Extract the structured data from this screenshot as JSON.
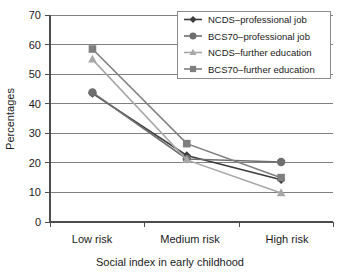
{
  "chart_data": {
    "type": "line",
    "title": "",
    "xlabel": "Social index in early childhood",
    "ylabel": "Percentages",
    "categories": [
      "Low risk",
      "Medium risk",
      "High risk"
    ],
    "ylim": [
      0,
      70
    ],
    "yticks": [
      0,
      10,
      20,
      30,
      40,
      50,
      60,
      70
    ],
    "grid": true,
    "legend_position": "top-right",
    "series": [
      {
        "name": "NCDS–professional job",
        "marker": "diamond",
        "color": "#3d3d3d",
        "values": [
          43.5,
          22.5,
          14.3
        ]
      },
      {
        "name": "BCS70–professional  job",
        "marker": "circle",
        "color": "#6e6e6e",
        "values": [
          43.8,
          21.3,
          20.3
        ]
      },
      {
        "name": "NCDS–further education",
        "marker": "triangle",
        "color": "#a8a8a8",
        "values": [
          55.0,
          21.0,
          9.8
        ]
      },
      {
        "name": "BCS70–further education",
        "marker": "square",
        "color": "#7f7f7f",
        "values": [
          58.5,
          26.5,
          15.0
        ]
      }
    ]
  },
  "axis": {
    "y_tick_labels": [
      "70",
      "60",
      "50",
      "40",
      "30",
      "20",
      "10",
      "0"
    ],
    "x_tick_labels": [
      "Low risk",
      "Medium risk",
      "High risk"
    ],
    "y_axis_title": "Percentages",
    "x_axis_title": "Social index in early childhood"
  },
  "legend": {
    "entries": [
      {
        "label": "NCDS–professional job"
      },
      {
        "label": "BCS70–professional  job"
      },
      {
        "label": "NCDS–further education"
      },
      {
        "label": "BCS70–further education"
      }
    ]
  },
  "colors": {
    "series_1": "#3d3d3d",
    "series_2": "#6e6e6e",
    "series_3": "#a8a8a8",
    "series_4": "#7f7f7f",
    "gridline": "#808080",
    "axis": "#4d4d4d",
    "background": "#ffffff"
  }
}
